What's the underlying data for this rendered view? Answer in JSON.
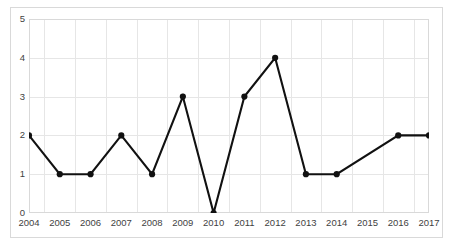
{
  "chart_data": {
    "type": "line",
    "title": "",
    "subtitle": "",
    "xlabel": "",
    "ylabel": "",
    "categories": [
      "2004",
      "2005",
      "2006",
      "2007",
      "2008",
      "2009",
      "2010",
      "2011",
      "2012",
      "2013",
      "2014",
      "2015",
      "2016",
      "2017"
    ],
    "values": [
      2,
      1,
      1,
      2,
      1,
      3,
      0,
      3,
      4,
      1,
      1,
      null,
      2,
      2
    ],
    "series": [
      {
        "name": "",
        "values": [
          2,
          1,
          1,
          2,
          1,
          3,
          0,
          3,
          4,
          1,
          1,
          null,
          2,
          2
        ],
        "color": "#111111",
        "marker": "filled-circle",
        "line_width": 2
      }
    ],
    "ylim": [
      0,
      5
    ],
    "y_ticks": [
      "0",
      "1",
      "2",
      "3",
      "4",
      "5"
    ],
    "y_tick_values": [
      0,
      1,
      2,
      3,
      4,
      5
    ],
    "x_ticks": [
      "2004",
      "2005",
      "2006",
      "2007",
      "2008",
      "2009",
      "2010",
      "2011",
      "2012",
      "2013",
      "2014",
      "2015",
      "2016",
      "2017"
    ],
    "grid": {
      "horizontal": true,
      "vertical": true,
      "color": "#e6e6e6"
    },
    "legend": {
      "visible": false,
      "position": "none",
      "entries": []
    },
    "annotations": []
  },
  "style": {
    "background_color": "#ffffff",
    "border_color": "#d9d9d9",
    "tick_label_color": "#3f3f3f",
    "series_color": "#111111"
  }
}
